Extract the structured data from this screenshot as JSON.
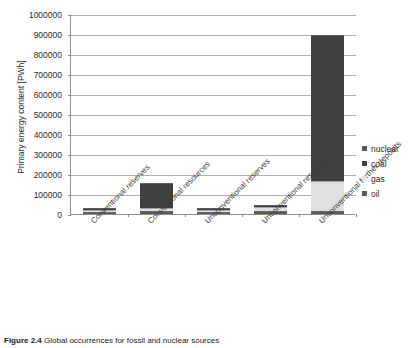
{
  "chart_data": {
    "type": "bar",
    "stacked": true,
    "title": "",
    "xlabel": "",
    "ylabel": "Primary energy content [PWh]",
    "ylim": [
      0,
      1000000
    ],
    "ytick_step": 100000,
    "ytick_labels": [
      "1000000",
      "900000",
      "800000",
      "700000",
      "600000",
      "500000",
      "400000",
      "300000",
      "200000",
      "100000",
      "0"
    ],
    "grid": true,
    "legend_position": "right",
    "categories": [
      "Conventional reserves",
      "Conventional resources",
      "Unconventional reserves",
      "Unconventional resources",
      "Unconventional further deposits"
    ],
    "series": [
      {
        "name": "oil",
        "color": "#5a5a5a",
        "values": [
          2000,
          8000,
          1000,
          12000,
          10000
        ]
      },
      {
        "name": "gas",
        "color": "#e0e0e0",
        "values": [
          3000,
          12000,
          5000,
          14000,
          145000
        ]
      },
      {
        "name": "coal",
        "color": "#404040",
        "values": [
          7000,
          120000,
          1000,
          1000,
          725000
        ]
      },
      {
        "name": "nuclear",
        "color": "#595959",
        "values": [
          0,
          0,
          0,
          0,
          0
        ]
      }
    ],
    "totals": [
      12000,
      140000,
      7000,
      27000,
      880000
    ]
  },
  "legend": {
    "entries": [
      {
        "label": "nuclear",
        "color": "#595959"
      },
      {
        "label": "coal",
        "color": "#404040"
      },
      {
        "label": "gas",
        "color": "#e0e0e0"
      },
      {
        "label": "oil",
        "color": "#5a5a5a"
      }
    ]
  },
  "caption": {
    "number": "Figure 2.4",
    "text": "Global occurrences for fossil and nuclear sources"
  },
  "colors": {
    "axis": "#8d8d8d",
    "grid": "#b0b0b0",
    "text": "#2b2b2b",
    "background": "#ffffff"
  }
}
